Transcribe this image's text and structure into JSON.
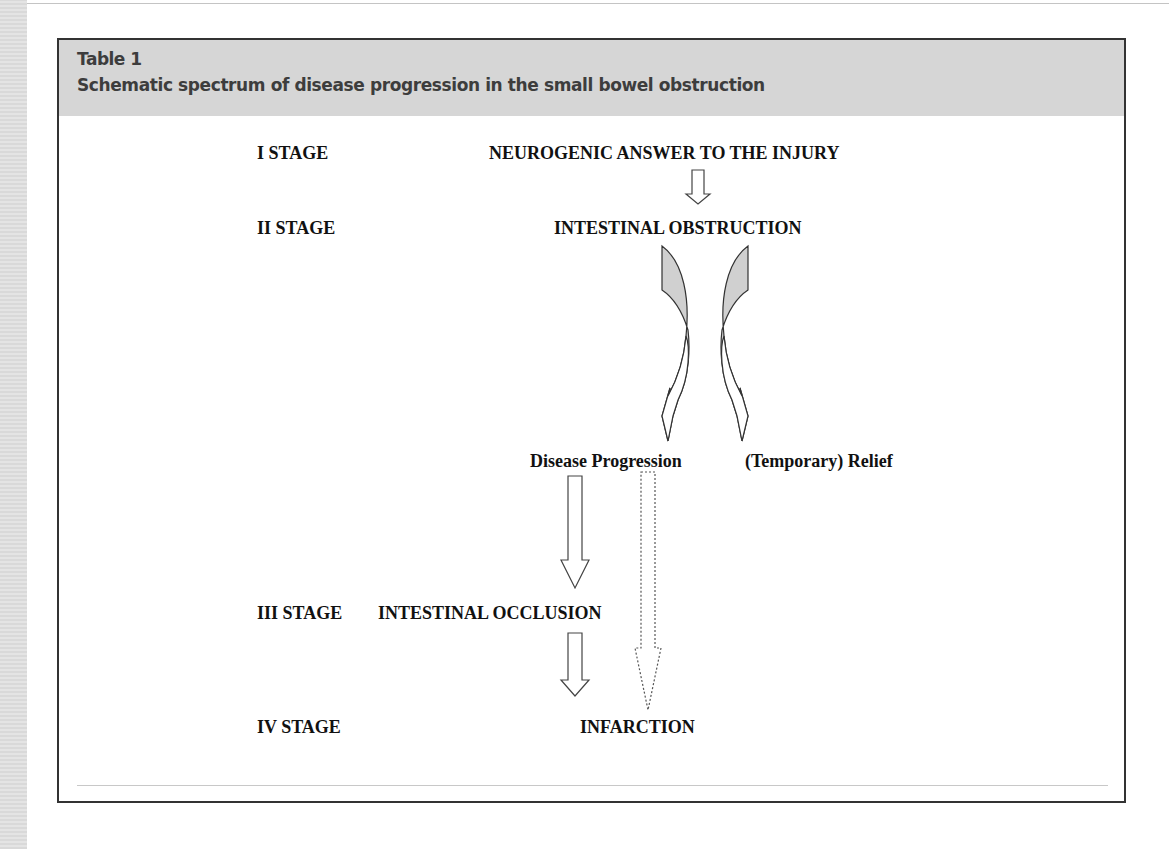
{
  "table": {
    "label": "Table 1",
    "caption": "Schematic spectrum of disease progression in the small bowel obstruction"
  },
  "stages": [
    {
      "stage": "I STAGE",
      "event": "NEUROGENIC ANSWER TO THE INJURY"
    },
    {
      "stage": "II STAGE",
      "event": "INTESTINAL OBSTRUCTION"
    },
    {
      "stage": "III STAGE",
      "event": "INTESTINAL OCCLUSION"
    },
    {
      "stage": "IV STAGE",
      "event": "INFARCTION"
    }
  ],
  "branches": {
    "left": "Disease Progression",
    "right": "(Temporary) Relief"
  },
  "arrows": [
    {
      "from": "NEUROGENIC ANSWER TO THE INJURY",
      "to": "INTESTINAL OBSTRUCTION",
      "style": "solid"
    },
    {
      "from": "INTESTINAL OBSTRUCTION",
      "to": "Disease Progression",
      "style": "curved-shaded"
    },
    {
      "from": "INTESTINAL OBSTRUCTION",
      "to": "(Temporary) Relief",
      "style": "curved-shaded"
    },
    {
      "from": "Disease Progression",
      "to": "INTESTINAL OCCLUSION",
      "style": "solid"
    },
    {
      "from": "Disease Progression",
      "to": "INFARCTION",
      "style": "dotted"
    },
    {
      "from": "INTESTINAL OCCLUSION",
      "to": "INFARCTION",
      "style": "solid"
    }
  ],
  "colors": {
    "header_band": "#d6d6d6",
    "arrow_fill_shaded": "#d0d0d0",
    "frame_border": "#333333"
  }
}
